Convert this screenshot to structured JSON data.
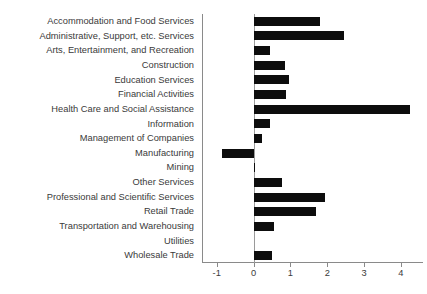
{
  "chart_data": {
    "type": "bar",
    "orientation": "horizontal",
    "title": "",
    "subtitle": "",
    "xlabel": "",
    "ylabel": "",
    "grid": false,
    "legend": null,
    "legend_position": "none",
    "bar_color": "#0d0d0d",
    "axis_color": "#8a8a8a",
    "text_color": "#3a3a3a",
    "xlim": [
      -1.4,
      4.6
    ],
    "xticks": [
      -1,
      0,
      1,
      2,
      3,
      4
    ],
    "xticklabels": [
      "-1",
      "0",
      "1",
      "2",
      "3",
      "4"
    ],
    "zero_reference": 0,
    "categories": [
      "Accommodation and Food Services",
      "Administrative, Support, etc. Services",
      "Arts, Entertainment, and Recreation",
      "Construction",
      "Education Services",
      "Financial Activities",
      "Health Care and Social Assistance",
      "Information",
      "Management of Companies",
      "Manufacturing",
      "Mining",
      "Other Services",
      "Professional and Scientific Services",
      "Retail Trade",
      "Transportation and Warehousing",
      "Utilities",
      "Wholesale Trade"
    ],
    "values": [
      1.8,
      2.45,
      0.45,
      0.85,
      0.95,
      0.89,
      4.25,
      0.44,
      0.22,
      -0.86,
      0.05,
      0.78,
      1.95,
      1.7,
      0.55,
      0.0,
      0.5
    ]
  }
}
